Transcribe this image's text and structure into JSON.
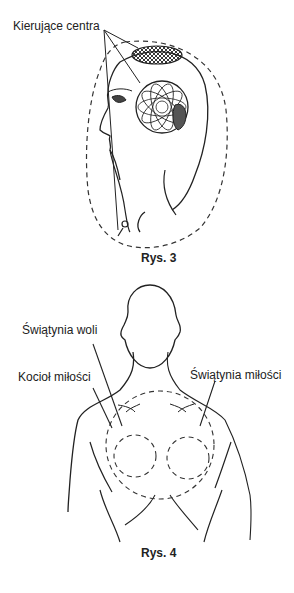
{
  "figure3": {
    "label_centers": "Kierujące centra",
    "caption": "Rys. 3"
  },
  "figure4": {
    "label_will_temple": "Świątynia woli",
    "label_love_cauldron": "Kocioł miłości",
    "label_love_temple": "Świątynia miłości",
    "caption": "Rys. 4"
  }
}
